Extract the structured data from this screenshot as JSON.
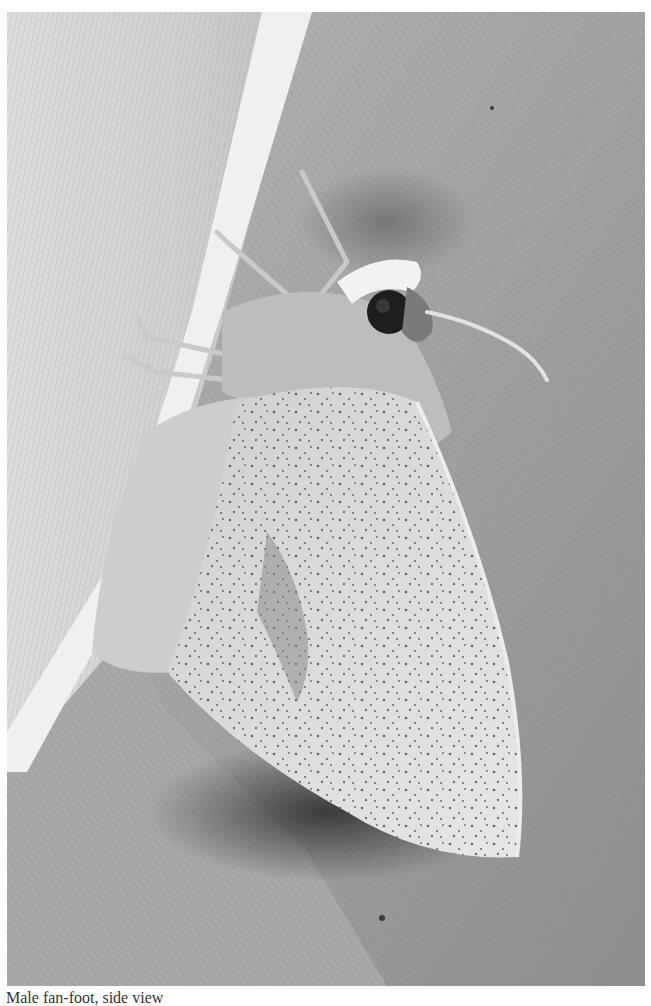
{
  "photo": {
    "subject": "moth resting on leaf",
    "description": "Grayscale close-up photograph of a pale, speckled moth clinging to the midrib of a large ribbed leaf, long antenna extended to the right",
    "tones": {
      "leaf_left_light": "#e4e4e4",
      "leaf_midrib": "#f2f2f2",
      "leaf_right_mid": "#a6a6a6",
      "shadow": "#3a3a3a",
      "wing_light": "#dedede",
      "speckle": "#3c3c3c",
      "eye": "#1e1e1e"
    }
  },
  "caption": {
    "text": "Male fan-foot, side view"
  }
}
